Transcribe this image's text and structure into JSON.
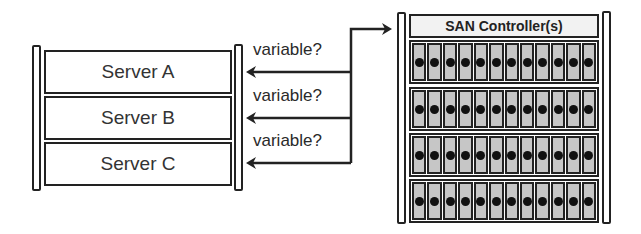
{
  "servers": {
    "items": [
      {
        "label": "Server A"
      },
      {
        "label": "Server B"
      },
      {
        "label": "Server C"
      }
    ]
  },
  "connections": {
    "labels": [
      "variable?",
      "variable?",
      "variable?"
    ]
  },
  "san": {
    "controller_label": "SAN Controller(s)",
    "shelves": 4,
    "drives_per_shelf": 12
  },
  "colors": {
    "line": "#222222",
    "drive_fill": "#c6c6c6",
    "controller_fill": "#f2f2f2"
  }
}
